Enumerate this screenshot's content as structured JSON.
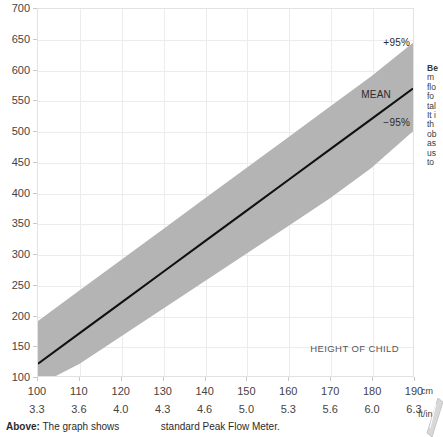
{
  "chart_data": {
    "type": "area",
    "title": "",
    "xlabel": "HEIGHT OF CHILD",
    "ylabel": "",
    "xlim": [
      100,
      190
    ],
    "ylim": [
      100,
      700
    ],
    "grid": true,
    "x_unit_primary": "cm",
    "x_unit_secondary": "ft/in",
    "x": [
      100,
      110,
      120,
      130,
      140,
      150,
      160,
      170,
      180,
      190
    ],
    "x_secondary": [
      "3.3",
      "3.6",
      "4.0",
      "4.3",
      "4.6",
      "5.0",
      "5.3",
      "5.6",
      "6.0",
      "6.3"
    ],
    "y_ticks": [
      100,
      150,
      200,
      250,
      300,
      350,
      400,
      450,
      500,
      550,
      600,
      650,
      700
    ],
    "series": [
      {
        "name": "MEAN",
        "values": [
          120,
          170,
          220,
          270,
          320,
          370,
          420,
          470,
          520,
          570
        ]
      },
      {
        "name": "+95%",
        "values": [
          190,
          240,
          290,
          340,
          390,
          440,
          490,
          540,
          590,
          645
        ]
      },
      {
        "name": "-95%",
        "values": [
          85,
          120,
          165,
          210,
          255,
          300,
          345,
          390,
          440,
          500
        ]
      }
    ],
    "band_color": "#b4b4b4",
    "mean_line_color": "#111111",
    "grid_color": "#ececec",
    "annotations": [
      {
        "text": "+95%",
        "series": "upper"
      },
      {
        "text": "MEAN",
        "series": "mean"
      },
      {
        "text": "−95%",
        "series": "lower"
      },
      {
        "text": "HEIGHT OF CHILD",
        "series": "axis"
      }
    ]
  },
  "plot": {
    "label_upper": "+95%",
    "label_mean": "MEAN",
    "label_lower": "−95%",
    "label_height_of_child": "HEIGHT OF CHILD"
  },
  "axes": {
    "y_labels": [
      "700",
      "650",
      "600",
      "550",
      "500",
      "450",
      "400",
      "350",
      "300",
      "250",
      "200",
      "150",
      "100"
    ],
    "x_labels_cm": [
      "100",
      "110",
      "120",
      "130",
      "140",
      "150",
      "160",
      "170",
      "180",
      "190"
    ],
    "x_labels_ftin": [
      "3.3",
      "3.6",
      "4.0",
      "4.3",
      "4.6",
      "5.0",
      "5.3",
      "5.6",
      "6.0",
      "6.3"
    ],
    "unit_cm": "cm",
    "unit_ftin": "ft/in"
  },
  "side_panel": {
    "lines": [
      "Be",
      "m",
      "flo",
      "fo",
      "tal",
      "It i",
      "th",
      "ob",
      "as",
      "us",
      "to"
    ]
  },
  "caption": {
    "strong": "Above:",
    "text_left": "The graph shows",
    "text_right": "standard Peak Flow Meter."
  }
}
